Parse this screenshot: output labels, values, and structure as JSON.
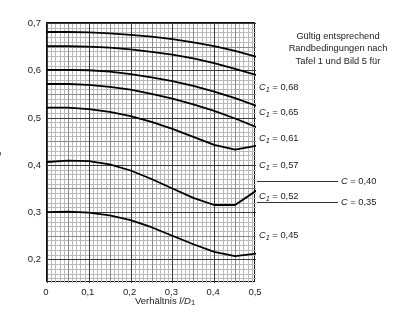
{
  "figure": {
    "ylabel": "Berechnungsbeiwert C",
    "ylabel_sub": "4",
    "xlabel_pre": "Verhältnis ",
    "xlabel_it": "l/D",
    "xlabel_sub": "1",
    "note_line1": "Gültig entsprechend",
    "note_line2": "Randbedingungen nach",
    "note_line3": "Tafel 1 und Bild 5 für"
  },
  "axes": {
    "xticks": [
      "0",
      "0,1",
      "0,2",
      "0,3",
      "0,4",
      "0,5"
    ],
    "yticks": [
      "0,2",
      "0,3",
      "0,4",
      "0,5",
      "0,6",
      "0,7"
    ]
  },
  "curve_labels": [
    {
      "sym": "C",
      "sub": "1",
      "eq": " = 0,68"
    },
    {
      "sym": "C",
      "sub": "1",
      "eq": " = 0,65"
    },
    {
      "sym": "C",
      "sub": "1",
      "eq": " = 0,61"
    },
    {
      "sym": "C",
      "sub": "1",
      "eq": " = 0,57"
    },
    {
      "sym": "C",
      "sub": "1",
      "eq": " = 0,52"
    },
    {
      "sym": "C",
      "sub": "1",
      "eq": " = 0,45"
    }
  ],
  "leader_labels": [
    {
      "sym": "C",
      "sub": "",
      "eq": " = 0,40"
    },
    {
      "sym": "C",
      "sub": "",
      "eq": " = 0,35"
    }
  ],
  "chart_data": {
    "type": "line",
    "title": "",
    "xlabel": "Verhältnis l/D1",
    "ylabel": "Berechnungsbeiwert C4",
    "xlim": [
      0,
      0.5
    ],
    "ylim": [
      0.15,
      0.7
    ],
    "grid": true,
    "grid_minor": true,
    "legend": "right-side inline labels",
    "x": [
      0,
      0.05,
      0.1,
      0.15,
      0.2,
      0.25,
      0.3,
      0.35,
      0.4,
      0.45,
      0.5
    ],
    "series": [
      {
        "name": "C1 = 0,68",
        "label": "C₁ = 0,68",
        "values": [
          0.681,
          0.681,
          0.68,
          0.678,
          0.675,
          0.671,
          0.666,
          0.659,
          0.651,
          0.641,
          0.629
        ]
      },
      {
        "name": "C1 = 0,65",
        "label": "C₁ = 0,65",
        "values": [
          0.651,
          0.651,
          0.65,
          0.648,
          0.644,
          0.639,
          0.633,
          0.625,
          0.615,
          0.603,
          0.59
        ]
      },
      {
        "name": "C1 = 0,61",
        "label": "C₁ = 0,61",
        "values": [
          0.601,
          0.601,
          0.6,
          0.597,
          0.592,
          0.585,
          0.577,
          0.567,
          0.555,
          0.541,
          0.525
        ]
      },
      {
        "name": "C1 = 0,57",
        "label": "C₁ = 0,57",
        "values": [
          0.571,
          0.571,
          0.569,
          0.565,
          0.559,
          0.55,
          0.54,
          0.528,
          0.514,
          0.498,
          0.48
        ]
      },
      {
        "name": "C1 = 0,52",
        "label": "C₁ = 0,52",
        "values": [
          0.521,
          0.521,
          0.518,
          0.512,
          0.503,
          0.491,
          0.476,
          0.459,
          0.442,
          0.432,
          0.44
        ]
      },
      {
        "name": "C1 = 0,45",
        "label": "C₁ = 0,45",
        "values": [
          0.406,
          0.409,
          0.408,
          0.401,
          0.388,
          0.37,
          0.35,
          0.33,
          0.315,
          0.315,
          0.345
        ]
      },
      {
        "name": "C = 0,40",
        "label": "C = 0,40",
        "values": [
          0.3,
          0.301,
          0.299,
          0.293,
          0.283,
          0.268,
          0.25,
          0.232,
          0.216,
          0.207,
          0.212
        ]
      },
      {
        "name": "C = 0,35",
        "label": "C = 0,35",
        "values": [
          0.3,
          0.301,
          0.299,
          0.293,
          0.283,
          0.268,
          0.25,
          0.232,
          0.216,
          0.207,
          0.212
        ]
      }
    ]
  }
}
